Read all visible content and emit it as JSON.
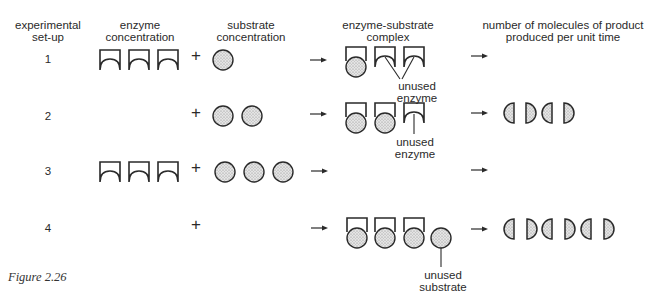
{
  "headers": {
    "setup": [
      "experimental",
      "set-up"
    ],
    "enzyme": [
      "enzyme",
      "concentration"
    ],
    "substrate": [
      "substrate",
      "concentration"
    ],
    "complex": [
      "enzyme-substrate",
      "complex"
    ],
    "product": [
      "number of molecules of product",
      "produced per unit time"
    ]
  },
  "rows": [
    {
      "setup": "1",
      "enzymes": 3,
      "substrates": 1,
      "complexes": 1,
      "unused_enzymes": 2,
      "unused_substrates": 0,
      "products": 0,
      "annotation": [
        "unused",
        "enzyme"
      ]
    },
    {
      "setup": "2",
      "enzymes": 0,
      "substrates": 2,
      "complexes": 2,
      "unused_enzymes": 1,
      "unused_substrates": 0,
      "products": 2,
      "annotation": [
        "unused",
        "enzyme"
      ]
    },
    {
      "setup": "3",
      "enzymes": 3,
      "substrates": 3,
      "complexes": 0,
      "unused_enzymes": 0,
      "unused_substrates": 0,
      "products": 0,
      "annotation": []
    },
    {
      "setup": "4",
      "enzymes": 0,
      "substrates": 0,
      "complexes": 3,
      "unused_enzymes": 0,
      "unused_substrates": 1,
      "products": 3,
      "annotation": [
        "unused",
        "substrate"
      ]
    }
  ],
  "symbols": {
    "plus": "+"
  },
  "caption": "Figure 2.26",
  "colors": {
    "stroke": "#2a2a2a",
    "fill": "#d6d6d6",
    "background": "#ffffff"
  }
}
